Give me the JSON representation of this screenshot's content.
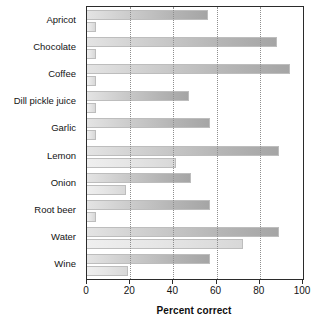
{
  "chart_data": {
    "type": "bar",
    "orientation": "horizontal",
    "title": "",
    "xlabel": "Percent correct",
    "ylabel": "",
    "xlim": [
      0,
      100
    ],
    "xticks": [
      0,
      20,
      40,
      60,
      80,
      100
    ],
    "xtick_labels": [
      "0",
      "20",
      "40",
      "60",
      "80",
      "100"
    ],
    "grid": "vertical-dotted-at-20-40-60-80",
    "legend": "none",
    "categories": [
      "Apricot",
      "Chocolate",
      "Coffee",
      "Dill pickle juice",
      "Garlic",
      "Lemon",
      "Onion",
      "Root beer",
      "Water",
      "Wine"
    ],
    "series": [
      {
        "name": "series-1",
        "values": [
          56,
          88,
          94,
          47,
          57,
          89,
          48,
          57,
          89,
          57
        ]
      },
      {
        "name": "series-2",
        "values": [
          4,
          4,
          4,
          4,
          4,
          41,
          18,
          4,
          72,
          19
        ]
      }
    ],
    "colors": {
      "series_1_fill_start": "#e4e4e4",
      "series_1_fill_end": "#a5a5a5",
      "series_2_fill_start": "#efefef",
      "series_2_fill_end": "#d8d8d8",
      "axis": "#2b2b2b",
      "gridline": "#8e8e8e",
      "text": "#141414",
      "background": "#ffffff"
    }
  }
}
